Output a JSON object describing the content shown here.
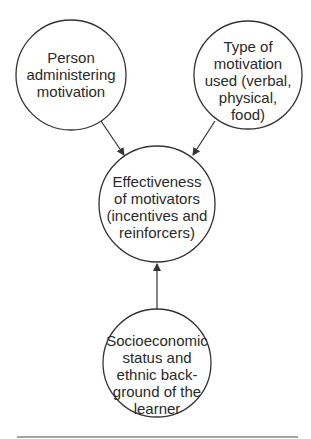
{
  "diagram": {
    "type": "influence-diagram",
    "colors": {
      "stroke": "#333333",
      "text": "#2a2a2a",
      "background": "#ffffff",
      "rule": "#8a8a8a"
    },
    "nodes": {
      "person": {
        "lines": [
          "Person",
          "administering",
          "motivation"
        ]
      },
      "type": {
        "lines": [
          "Type of",
          "motivation",
          "used (verbal,",
          "physical,",
          "food)"
        ]
      },
      "effectiveness": {
        "lines": [
          "Effectiveness",
          "of motivators",
          "(incentives and",
          "reinforcers)"
        ]
      },
      "socioeconomic": {
        "lines": [
          "Socioeconomic",
          "status and",
          "ethnic back-",
          "ground of the",
          "learner"
        ]
      }
    },
    "edges": [
      {
        "from": "person",
        "to": "effectiveness"
      },
      {
        "from": "type",
        "to": "effectiveness"
      },
      {
        "from": "socioeconomic",
        "to": "effectiveness"
      }
    ]
  }
}
